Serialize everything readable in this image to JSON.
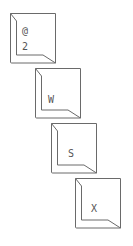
{
  "diagram": {
    "stroke_color": "#6a6a6a",
    "keys": [
      {
        "id": "key-2",
        "top_label": "@",
        "bottom_label": "2",
        "x": 9,
        "y": 12
      },
      {
        "id": "key-w",
        "label": "W",
        "x": 34,
        "y": 67
      },
      {
        "id": "key-s",
        "label": "S",
        "x": 50,
        "y": 122
      },
      {
        "id": "key-x",
        "label": "X",
        "x": 74,
        "y": 177
      }
    ]
  }
}
